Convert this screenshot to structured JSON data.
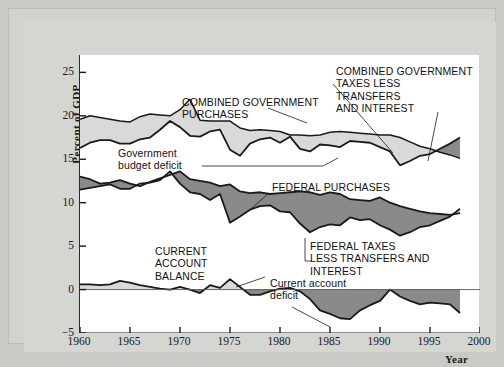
{
  "figure": {
    "y_axis_title": "Percent of GDP",
    "x_axis_title": "Year"
  },
  "annotations": {
    "combined_purchases": "COMBINED GOVERNMENT\nPURCHASES",
    "combined_taxes": "COMBINED GOVERNMENT\nTAXES LESS\nTRANSFERS\nAND INTEREST",
    "government_budget_deficit": "Government\nbudget deficit",
    "federal_purchases": "FEDERAL PURCHASES",
    "federal_taxes": "FEDERAL TAXES\n    LESS TRANSFERS AND INTEREST",
    "current_account_balance": "CURRENT\nACCOUNT\nBALANCE",
    "current_account_deficit": "Current account\ndeficit"
  },
  "colors": {
    "deficit_fill": "#d9d9d9",
    "surplus_fill": "#8a8a8a",
    "line": "#1a1a1a",
    "panel": "#d5d5d2",
    "plot_background": "#ffffff"
  },
  "chart_data": {
    "type": "line",
    "title": "",
    "subtitle": "",
    "xlabel": "Year",
    "ylabel": "Percent of GDP",
    "xlim": [
      1960,
      2000
    ],
    "ylim": [
      -5,
      27
    ],
    "ytick_labels": [
      "25",
      "20",
      "15",
      "10",
      "5",
      "0",
      "−5"
    ],
    "yticks": [
      25,
      20,
      15,
      10,
      5,
      0,
      -5
    ],
    "xticks": [
      1960,
      1965,
      1970,
      1975,
      1980,
      1985,
      1990,
      1995,
      2000
    ],
    "xtick_labels": [
      "1960",
      "1965",
      "1970",
      "1975",
      "1980",
      "1985",
      "1990",
      "1995",
      "2000"
    ],
    "grid": false,
    "legend": "none (inline annotations)",
    "x": [
      1960,
      1961,
      1962,
      1963,
      1964,
      1965,
      1966,
      1967,
      1968,
      1969,
      1970,
      1971,
      1972,
      1973,
      1974,
      1975,
      1976,
      1977,
      1978,
      1979,
      1980,
      1981,
      1982,
      1983,
      1984,
      1985,
      1986,
      1987,
      1988,
      1989,
      1990,
      1991,
      1992,
      1993,
      1994,
      1995,
      1996,
      1997,
      1998
    ],
    "series": [
      {
        "name": "COMBINED GOVERNMENT PURCHASES",
        "values": [
          19.6,
          20.0,
          19.8,
          19.6,
          19.4,
          19.3,
          19.9,
          20.2,
          20.1,
          20.0,
          20.7,
          21.9,
          19.5,
          19.4,
          19.4,
          19.4,
          18.6,
          18.3,
          18.4,
          18.3,
          18.2,
          17.8,
          17.8,
          17.7,
          17.8,
          18.1,
          18.2,
          18.1,
          18.0,
          17.9,
          17.8,
          17.8,
          17.5,
          17.0,
          16.5,
          16.2,
          15.8,
          15.5,
          15.1
        ]
      },
      {
        "name": "COMBINED GOVERNMENT TAXES LESS TRANSFERS AND INTEREST",
        "values": [
          16.3,
          16.9,
          17.2,
          17.2,
          16.8,
          16.8,
          17.3,
          17.5,
          18.4,
          19.4,
          18.7,
          17.7,
          17.6,
          18.2,
          18.4,
          16.1,
          15.4,
          16.8,
          17.3,
          17.5,
          16.9,
          17.6,
          16.2,
          15.9,
          16.7,
          16.6,
          16.4,
          17.1,
          17.0,
          16.9,
          16.4,
          15.9,
          14.3,
          14.8,
          15.4,
          15.6,
          16.2,
          16.8,
          17.5
        ]
      },
      {
        "name": "FEDERAL PURCHASES",
        "values": [
          13.0,
          12.7,
          12.2,
          12.3,
          12.6,
          12.2,
          11.9,
          12.4,
          12.8,
          13.2,
          13.6,
          12.7,
          12.5,
          12.3,
          11.9,
          12.1,
          11.3,
          11.1,
          11.2,
          11.0,
          11.1,
          11.2,
          11.3,
          11.2,
          10.9,
          11.2,
          11.0,
          10.4,
          10.3,
          10.2,
          10.6,
          10.0,
          9.6,
          9.3,
          9.0,
          8.8,
          8.7,
          8.6,
          8.8
        ]
      },
      {
        "name": "FEDERAL TAXES LESS TRANSFERS AND INTEREST",
        "values": [
          11.5,
          11.7,
          11.9,
          12.1,
          11.6,
          11.6,
          12.2,
          12.3,
          12.6,
          13.6,
          12.2,
          11.2,
          11.0,
          10.3,
          11.0,
          7.7,
          8.4,
          9.2,
          9.6,
          9.7,
          9.0,
          8.9,
          7.6,
          6.6,
          7.2,
          7.5,
          7.4,
          8.3,
          8.0,
          8.1,
          7.4,
          6.9,
          6.2,
          6.6,
          7.2,
          7.4,
          7.9,
          8.4,
          9.3
        ]
      },
      {
        "name": "CURRENT ACCOUNT BALANCE",
        "values": [
          0.6,
          0.6,
          0.5,
          0.6,
          1.0,
          0.8,
          0.5,
          0.3,
          0.1,
          0.0,
          0.3,
          0.0,
          -0.4,
          0.5,
          0.2,
          1.2,
          0.3,
          -0.6,
          -0.6,
          -0.2,
          0.1,
          0.2,
          -0.2,
          -1.1,
          -2.4,
          -2.8,
          -3.3,
          -3.4,
          -2.4,
          -1.8,
          -1.3,
          0.0,
          -0.8,
          -1.3,
          -1.7,
          -1.5,
          -1.6,
          -1.7,
          -2.7
        ]
      }
    ],
    "filled_bands": [
      {
        "name": "Government budget deficit",
        "upper_series": "COMBINED GOVERNMENT PURCHASES",
        "lower_series": "COMBINED GOVERNMENT TAXES LESS TRANSFERS AND INTEREST",
        "fill_when_upper_above": "#d9d9d9",
        "fill_when_lower_above": "#8a8a8a"
      },
      {
        "name": "Federal deficit",
        "upper_series": "FEDERAL PURCHASES",
        "lower_series": "FEDERAL TAXES LESS TRANSFERS AND INTEREST",
        "fill_when_upper_above": "#8a8a8a",
        "fill_when_lower_above": "#d9d9d9"
      },
      {
        "name": "Current account deficit",
        "upper_series": "CURRENT ACCOUNT BALANCE",
        "lower_series": "zero line",
        "fill_when_upper_above": "#d9d9d9",
        "fill_when_lower_above": "#8a8a8a"
      }
    ]
  }
}
